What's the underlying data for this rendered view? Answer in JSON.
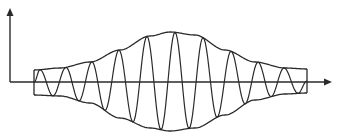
{
  "diagram": {
    "title": "",
    "type": "amplitude-modulated-wave",
    "colors": {
      "stroke": "#2a2a2a",
      "background": "#ffffff"
    },
    "axes": {
      "y_axis": {
        "x": 10,
        "y_top": 8,
        "y_bottom": 82,
        "arrow": "up"
      },
      "x_axis": {
        "y": 82,
        "x_left": 10,
        "x_right": 332,
        "arrow": "right"
      }
    },
    "envelope": {
      "x_start": 34,
      "x_end": 307,
      "upper": [
        [
          34,
          70
        ],
        [
          60,
          68
        ],
        [
          90,
          62
        ],
        [
          120,
          50
        ],
        [
          150,
          36
        ],
        [
          170,
          32
        ],
        [
          195,
          35
        ],
        [
          225,
          50
        ],
        [
          255,
          62
        ],
        [
          285,
          68
        ],
        [
          307,
          69
        ]
      ],
      "lower": [
        [
          34,
          95
        ],
        [
          60,
          96
        ],
        [
          90,
          103
        ],
        [
          120,
          118
        ],
        [
          150,
          128
        ],
        [
          170,
          131
        ],
        [
          195,
          128
        ],
        [
          225,
          115
        ],
        [
          255,
          100
        ],
        [
          285,
          94
        ],
        [
          307,
          93
        ]
      ]
    },
    "carrier": {
      "peaks_x": [
        40,
        66,
        92,
        119,
        147,
        175,
        203,
        231,
        258,
        284
      ],
      "troughs_x": [
        53,
        79,
        105,
        133,
        161,
        189,
        217,
        245,
        271,
        298
      ],
      "end_connectors": [
        [
          34,
          70,
          34,
          95
        ],
        [
          307,
          69,
          307,
          93
        ]
      ]
    },
    "labels": []
  }
}
